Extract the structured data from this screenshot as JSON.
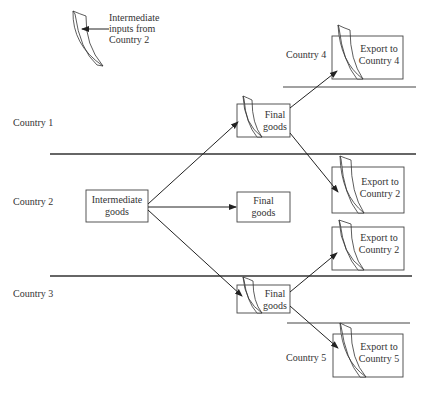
{
  "legend": {
    "text_line1": "Intermediate",
    "text_line2": "inputs from",
    "text_line3": "Country 2",
    "icon": "folded-page-icon"
  },
  "countries": {
    "c1": "Country 1",
    "c2": "Country 2",
    "c3": "Country 3",
    "c4": "Country 4",
    "c5": "Country 5"
  },
  "boxes": {
    "intermediate_goods": {
      "line1": "Intermediate",
      "line2": "goods"
    },
    "final_goods_c1": {
      "line1": "Final",
      "line2": "goods"
    },
    "final_goods_c2": {
      "line1": "Final",
      "line2": "goods"
    },
    "final_goods_c3": {
      "line1": "Final",
      "line2": "goods"
    },
    "export_c4": {
      "line1": "Export to",
      "line2": "Country 4"
    },
    "export_c2_from_c1": {
      "line1": "Export to",
      "line2": "Country 2"
    },
    "export_c2_from_c3": {
      "line1": "Export to",
      "line2": "Country 2"
    },
    "export_c5": {
      "line1": "Export to",
      "line2": "Country 5"
    }
  },
  "colors": {
    "line": "#333333",
    "background": "#ffffff"
  }
}
